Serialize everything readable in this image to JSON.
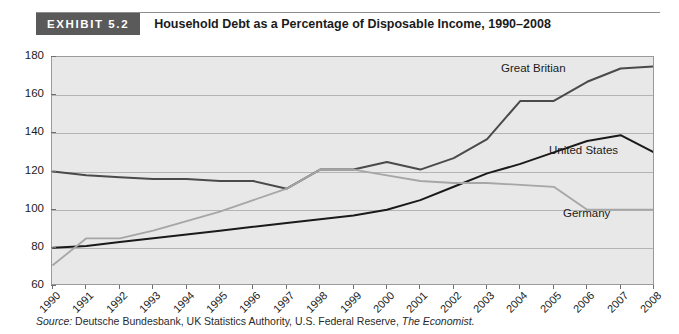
{
  "header": {
    "tag": "EXHIBIT 5.2",
    "title": "Household Debt as a Percentage of Disposable Income, 1990–2008"
  },
  "source": {
    "prefix": "Source:",
    "body": " Deutsche Bundesbank, UK Statistics Authority, U.S. Federal Reserve, ",
    "publication": "The Economist."
  },
  "series_labels": {
    "great_britain": "Great Britian",
    "united_states": "United States",
    "germany": "Germany"
  },
  "colors": {
    "great_britain": "#4a4a4a",
    "united_states": "#1a1a1a",
    "germany": "#a6a6a6",
    "plot_background": "#e8e8e8",
    "gridline": "#b4b4b4",
    "frame": "#9a9a9a",
    "tag_background": "#5a5a5a"
  },
  "chart_data": {
    "type": "line",
    "title": "Household Debt as a Percentage of Disposable Income, 1990–2008",
    "xlabel": "",
    "ylabel": "",
    "ylim": [
      60,
      180
    ],
    "yticks": [
      60,
      80,
      100,
      120,
      140,
      160,
      180
    ],
    "grid": true,
    "legend": "inline-annotations",
    "x": [
      1990,
      1991,
      1992,
      1993,
      1994,
      1995,
      1996,
      1997,
      1998,
      1999,
      2000,
      2001,
      2002,
      2003,
      2004,
      2005,
      2006,
      2007,
      2008
    ],
    "categories": [
      "1990",
      "1991",
      "1992",
      "1993",
      "1994",
      "1995",
      "1996",
      "1997",
      "1998",
      "1999",
      "2000",
      "2001",
      "2002",
      "2003",
      "2004",
      "2005",
      "2006",
      "2007",
      "2008"
    ],
    "series": [
      {
        "name": "Great Britian",
        "color": "#4a4a4a",
        "values": [
          120,
          118,
          117,
          116,
          116,
          115,
          115,
          111,
          121,
          121,
          125,
          121,
          127,
          137,
          157,
          157,
          167,
          174,
          175
        ]
      },
      {
        "name": "United States",
        "color": "#1a1a1a",
        "values": [
          80,
          81,
          83,
          85,
          87,
          89,
          91,
          93,
          95,
          97,
          100,
          105,
          112,
          119,
          124,
          130,
          136,
          139,
          130
        ]
      },
      {
        "name": "Germany",
        "color": "#a6a6a6",
        "values": [
          71,
          85,
          85,
          89,
          94,
          99,
          105,
          111,
          121,
          121,
          118,
          115,
          114,
          114,
          113,
          112,
          100,
          100,
          100
        ]
      }
    ]
  }
}
